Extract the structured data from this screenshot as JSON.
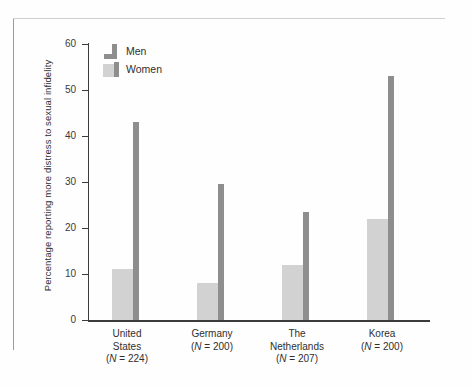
{
  "figure": {
    "background": "#fefefe",
    "frame_color": "#9a9a9a"
  },
  "legend": {
    "position": "inside-top-left",
    "items": [
      {
        "label": "Men",
        "swatch": "men-swatch-icon",
        "color": "#8e8e8e"
      },
      {
        "label": "Women",
        "swatch": "women-swatch-icon",
        "color": "#d2d2d2"
      }
    ]
  },
  "axes": {
    "y_title": "Percentage reporting more distress to sexual infidelity",
    "y_ticks": [
      "0",
      "10",
      "20",
      "30",
      "40",
      "50",
      "60"
    ],
    "y_min": 0,
    "y_max": 60,
    "x_title": ""
  },
  "x_labels": [
    {
      "name_line1": "United",
      "name_line2": "States",
      "n_label": "(N = 224)"
    },
    {
      "name_line1": "Germany",
      "name_line2": "",
      "n_label": "(N = 200)"
    },
    {
      "name_line1": "The",
      "name_line2": "Netherlands",
      "n_label": "(N = 207)"
    },
    {
      "name_line1": "Korea",
      "name_line2": "",
      "n_label": "(N = 200)"
    }
  ],
  "chart_data": {
    "type": "bar",
    "title": "",
    "xlabel": "",
    "ylabel": "Percentage reporting more distress to sexual infidelity",
    "ylim": [
      0,
      60
    ],
    "yticks": [
      0,
      10,
      20,
      30,
      40,
      50,
      60
    ],
    "grid": false,
    "legend_position": "upper left (inside plot area)",
    "categories": [
      "United States (N = 224)",
      "Germany (N = 200)",
      "The Netherlands (N = 207)",
      "Korea (N = 200)"
    ],
    "series": [
      {
        "name": "Men",
        "color": "#8e8e8e",
        "values": [
          43,
          29.5,
          23.5,
          53
        ]
      },
      {
        "name": "Women",
        "color": "#d2d2d2",
        "values": [
          11,
          8,
          12,
          22
        ]
      }
    ]
  }
}
